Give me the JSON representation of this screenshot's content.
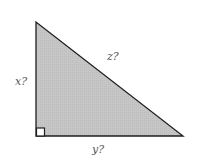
{
  "diagram": {
    "type": "right-triangle",
    "fill_color": "#c4c4c4",
    "stroke_color": "#1e1e1e",
    "vertices": {
      "top": [
        36,
        22
      ],
      "right_angle": [
        36,
        136
      ],
      "right": [
        183,
        136
      ]
    },
    "labels": {
      "vertical_leg": "x?",
      "horizontal_leg": "y?",
      "hypotenuse": "z?"
    },
    "right_angle_marker": true
  }
}
